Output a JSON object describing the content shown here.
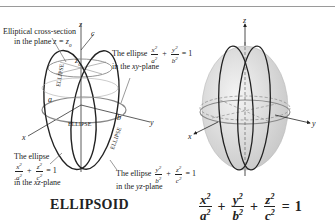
{
  "figure": {
    "left_diagram": {
      "labels": {
        "cross_section_line1": "Elliptical cross-section",
        "cross_section_line2_prefix": "in the plane ",
        "cross_section_plane": "z = z",
        "cross_section_sub": "0",
        "xy_ellipse_prefix": "The ellipse",
        "xy_plane": "in the xy-plane",
        "xz_ellipse_prefix": "The ellipse",
        "xz_plane": "in the xz-plane",
        "yz_ellipse_prefix": "The ellipse",
        "yz_plane": "in the yz-plane",
        "ellipse_tag": "ELLIPSE",
        "axis_x": "x",
        "axis_y": "y",
        "axis_z": "z",
        "param_a": "a",
        "param_b": "b",
        "param_c": "c",
        "param_z0": "z",
        "param_z0_sub": "0"
      },
      "equations": {
        "xy": {
          "t1_num": "x",
          "t1_den": "a",
          "t2_num": "y",
          "t2_den": "b",
          "rhs": "= 1",
          "plus": "+"
        },
        "xz": {
          "t1_num": "x",
          "t1_den": "a",
          "t2_num": "z",
          "t2_den": "c",
          "rhs": "= 1",
          "plus": "+"
        },
        "yz": {
          "t1_num": "y",
          "t1_den": "b",
          "t2_num": "z",
          "t2_den": "c",
          "rhs": "= 1",
          "plus": "+"
        },
        "exp": "2"
      }
    },
    "right_diagram": {
      "axis_x": "x",
      "axis_y": "y",
      "axis_z": "z",
      "fill_color": "#dcdcdc",
      "stroke_color": "#222222"
    },
    "caption": {
      "title": "ELLIPSOID",
      "equation": {
        "t1_num": "x",
        "t1_den": "a",
        "t2_num": "y",
        "t2_den": "b",
        "t3_num": "z",
        "t3_den": "c",
        "exp": "2",
        "plus": "+",
        "equals": "=",
        "rhs": "1"
      }
    }
  }
}
